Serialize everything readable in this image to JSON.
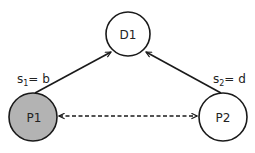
{
  "diagram": {
    "nodes": [
      {
        "id": "D1",
        "label": "D1",
        "cx": 128,
        "cy": 34,
        "r": 22,
        "fill": "#ffffff",
        "stroke": "#1a1a1a"
      },
      {
        "id": "P1",
        "label": "P1",
        "cx": 33,
        "cy": 117,
        "r": 24,
        "fill": "#b3b3b3",
        "stroke": "#1a1a1a"
      },
      {
        "id": "P2",
        "label": "P2",
        "cx": 223,
        "cy": 117,
        "r": 24,
        "fill": "#ffffff",
        "stroke": "#1a1a1a"
      }
    ],
    "edges": [
      {
        "from": "P1",
        "to": "D1",
        "style": "solid",
        "direction": "forward",
        "label_base": "s",
        "label_sub": "1",
        "label_rest": "= b"
      },
      {
        "from": "P2",
        "to": "D1",
        "style": "solid",
        "direction": "forward",
        "label_base": "s",
        "label_sub": "2",
        "label_rest": "= d"
      },
      {
        "from": "P1",
        "to": "P2",
        "style": "dashed",
        "direction": "bidirectional"
      }
    ],
    "colors": {
      "stroke": "#1a1a1a",
      "highlight_fill": "#b3b3b3",
      "background": "#ffffff"
    }
  }
}
